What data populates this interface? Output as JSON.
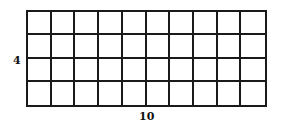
{
  "diagram": {
    "type": "rectangle-grid",
    "rows": 4,
    "columns": 10,
    "labels": {
      "height": "4",
      "width": "10"
    },
    "colors": {
      "line": "#1a1a1a",
      "background": "#ffffff",
      "text": "#111111"
    }
  }
}
